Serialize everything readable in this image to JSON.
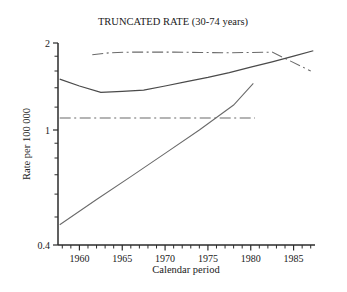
{
  "chart_data": {
    "type": "line",
    "title": "TRUNCATED RATE (30-74 years)",
    "xlabel": "Calendar period",
    "ylabel": "Rate per 100 000",
    "yscale": "log",
    "ylim": [
      0.4,
      2
    ],
    "ytick_labels": [
      "2",
      "1",
      "0.4"
    ],
    "ytick_values": [
      2,
      1,
      0.4
    ],
    "xlim": [
      1957.5,
      1987.5
    ],
    "xtick_labels": [
      "1960",
      "1965",
      "1970",
      "1975",
      "1980",
      "1985"
    ],
    "xtick_values": [
      1960,
      1965,
      1970,
      1975,
      1980,
      1985
    ],
    "xminor_step": 1,
    "grid": false,
    "legend": "none",
    "series": [
      {
        "name": "upper-dash-dot",
        "style": "dash-dot",
        "x": [
          1961.5,
          1963.5,
          1966.0,
          1968.5,
          1971.0,
          1974.0,
          1977.0,
          1980.0,
          1982.5,
          1984.5,
          1987.0
        ],
        "y": [
          1.82,
          1.85,
          1.86,
          1.86,
          1.86,
          1.855,
          1.85,
          1.855,
          1.86,
          1.74,
          1.6
        ]
      },
      {
        "name": "solid-curve",
        "style": "solid",
        "x": [
          1957.7,
          1960.0,
          1962.5,
          1965.0,
          1967.5,
          1970.0,
          1972.5,
          1975.0,
          1977.5,
          1980.0,
          1982.5,
          1985.0,
          1987.3
        ],
        "y": [
          1.5,
          1.42,
          1.35,
          1.36,
          1.375,
          1.42,
          1.47,
          1.52,
          1.58,
          1.65,
          1.72,
          1.8,
          1.88
        ]
      },
      {
        "name": "middle-horizontal-dash-dot",
        "style": "dash-dot",
        "x": [
          1957.7,
          1962.0,
          1966.0,
          1970.0,
          1974.0,
          1978.0,
          1980.5
        ],
        "y": [
          1.1,
          1.1,
          1.1,
          1.1,
          1.1,
          1.1,
          1.1
        ]
      },
      {
        "name": "rising-diagonal",
        "style": "solid",
        "x": [
          1957.7,
          1962.0,
          1966.0,
          1970.0,
          1974.0,
          1978.0,
          1980.3
        ],
        "y": [
          0.47,
          0.575,
          0.69,
          0.83,
          1.0,
          1.22,
          1.45
        ]
      }
    ]
  },
  "figure": {
    "title": "TRUNCATED RATE (30-74 years)",
    "x_axis_label": "Calendar period",
    "y_axis_label": "Rate per 100 000",
    "y_tick_top": "2",
    "y_tick_mid": "1",
    "y_tick_bottom": "0.4",
    "x_ticks": [
      "1960",
      "1965",
      "1970",
      "1975",
      "1980",
      "1985"
    ]
  }
}
